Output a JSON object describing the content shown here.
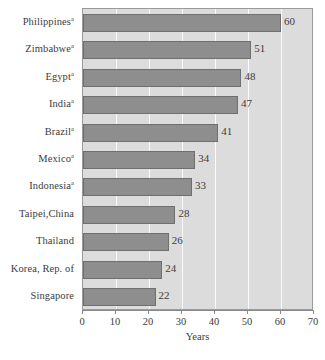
{
  "chart_data": {
    "type": "bar",
    "orientation": "horizontal",
    "title": "",
    "subtitle": "",
    "xlabel": "Years",
    "ylabel": "",
    "xlim": [
      0,
      70
    ],
    "ylim": null,
    "xticks": [
      0,
      10,
      20,
      30,
      40,
      50,
      60,
      70
    ],
    "grid": "vertical gridlines at each x tick, white on light gray plot background",
    "legend": null,
    "legend_position": "none",
    "categories": [
      "Philippines",
      "Zimbabwe",
      "Egypt",
      "India",
      "Brazil",
      "Mexico",
      "Indonesia",
      "Taipei,China",
      "Thailand",
      "Korea, Rep. of",
      "Singapore"
    ],
    "category_footnote_markers": [
      "a",
      "a",
      "a",
      "a",
      "a",
      "a",
      "a",
      "",
      "",
      "",
      ""
    ],
    "values": [
      60,
      51,
      48,
      47,
      41,
      34,
      33,
      28,
      26,
      24,
      22
    ],
    "data_labels": [
      "60",
      "51",
      "48",
      "47",
      "41",
      "34",
      "33",
      "28",
      "26",
      "24",
      "22"
    ],
    "bar_color": "#8e8e8e",
    "plot_background_color": "#dcdcdc",
    "gridline_color": "#fbfbfb",
    "axis_color": "#8a8a8a"
  },
  "axis": {
    "x_title": "Years",
    "tick_labels": [
      "0",
      "10",
      "20",
      "30",
      "40",
      "50",
      "60",
      "70"
    ]
  },
  "footnote": {
    "fragment": ""
  }
}
